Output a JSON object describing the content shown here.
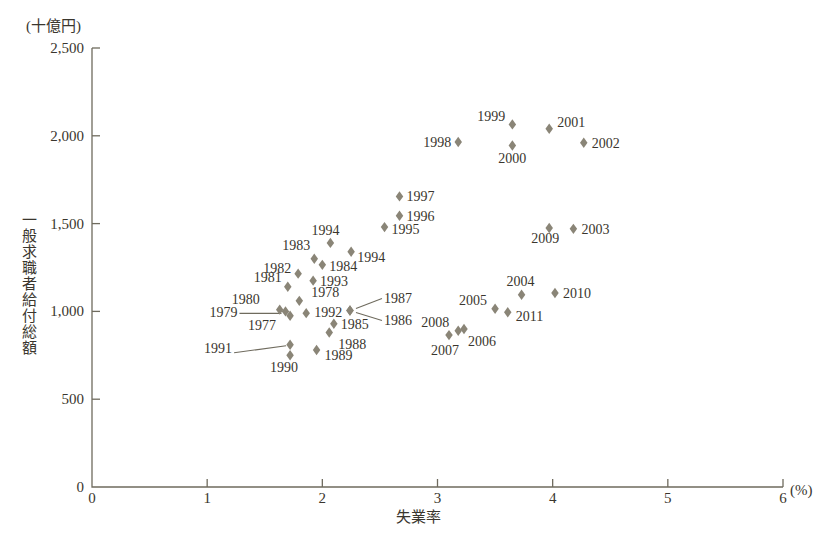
{
  "chart_data": {
    "type": "scatter",
    "title": "",
    "unit_label": "(十億円)",
    "xlabel": "失業率",
    "ylabel": "一般求職者給付総額",
    "x_unit": "(%)",
    "xlim": [
      0,
      6
    ],
    "ylim": [
      0,
      2500
    ],
    "xticks": [
      0,
      1,
      2,
      3,
      4,
      5,
      6
    ],
    "xtick_labels": [
      "0",
      "1",
      "2",
      "3",
      "4",
      "5",
      "6"
    ],
    "yticks": [
      0,
      500,
      1000,
      1500,
      2000,
      2500
    ],
    "ytick_labels": [
      "0",
      "500",
      "1,000",
      "1,500",
      "2,000",
      "2,500"
    ],
    "grid": false,
    "legend": "none",
    "marker_color": "#8a8577",
    "points": [
      {
        "label": "1977",
        "x": 1.72,
        "y": 975
      },
      {
        "label": "1978",
        "x": 1.8,
        "y": 1060
      },
      {
        "label": "1979",
        "x": 1.68,
        "y": 1000
      },
      {
        "label": "1980",
        "x": 1.63,
        "y": 1010
      },
      {
        "label": "1981",
        "x": 1.7,
        "y": 1140
      },
      {
        "label": "1982",
        "x": 1.79,
        "y": 1215
      },
      {
        "label": "1983",
        "x": 1.93,
        "y": 1300
      },
      {
        "label": "1984",
        "x": 2.0,
        "y": 1265
      },
      {
        "label": "1985",
        "x": 2.1,
        "y": 930
      },
      {
        "label": "1986",
        "x": 2.24,
        "y": 1005
      },
      {
        "label": "1987",
        "x": 2.24,
        "y": 1005
      },
      {
        "label": "1988",
        "x": 2.06,
        "y": 880
      },
      {
        "label": "1989",
        "x": 1.95,
        "y": 780
      },
      {
        "label": "1990",
        "x": 1.72,
        "y": 750
      },
      {
        "label": "1991",
        "x": 1.72,
        "y": 810
      },
      {
        "label": "1992",
        "x": 1.86,
        "y": 990
      },
      {
        "label": "1993",
        "x": 1.92,
        "y": 1175
      },
      {
        "label": "1994",
        "x": 2.07,
        "y": 1390
      },
      {
        "label": "2995",
        "x": 2.25,
        "y": 1340
      },
      {
        "label": "1995",
        "x": 2.54,
        "y": 1480
      },
      {
        "label": "1996",
        "x": 2.67,
        "y": 1545
      },
      {
        "label": "1997",
        "x": 2.67,
        "y": 1655
      },
      {
        "label": "1998",
        "x": 3.18,
        "y": 1965
      },
      {
        "label": "1999",
        "x": 3.65,
        "y": 2065
      },
      {
        "label": "2000",
        "x": 3.65,
        "y": 1945
      },
      {
        "label": "2001",
        "x": 3.97,
        "y": 2040
      },
      {
        "label": "2002",
        "x": 4.27,
        "y": 1960
      },
      {
        "label": "2003",
        "x": 4.18,
        "y": 1470
      },
      {
        "label": "2004",
        "x": 3.73,
        "y": 1095
      },
      {
        "label": "2005",
        "x": 3.5,
        "y": 1015
      },
      {
        "label": "2006",
        "x": 3.23,
        "y": 900
      },
      {
        "label": "2007",
        "x": 3.1,
        "y": 865
      },
      {
        "label": "2008",
        "x": 3.18,
        "y": 890
      },
      {
        "label": "2009",
        "x": 3.97,
        "y": 1475
      },
      {
        "label": "2010",
        "x": 4.02,
        "y": 1105
      },
      {
        "label": "2011",
        "x": 3.61,
        "y": 995
      }
    ]
  },
  "labels_note": "data point year labels rendered beside each marker"
}
